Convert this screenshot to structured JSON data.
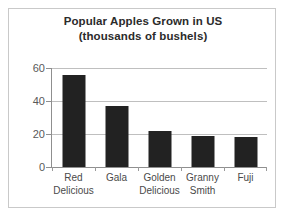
{
  "chart_data": {
    "type": "bar",
    "title": "Popular Apples Grown in US",
    "subtitle": "(thousands of bushels)",
    "xlabel": "",
    "ylabel": "",
    "ylim": [
      0,
      60
    ],
    "yticks": [
      0,
      20,
      40,
      60
    ],
    "ytick_labels": [
      "0",
      "20",
      "40",
      "60"
    ],
    "grid": true,
    "legend": "none",
    "categories": [
      "Red Delicious",
      "Gala",
      "Golden Delicious",
      "Granny Smith",
      "Fuji"
    ],
    "category_lines": [
      [
        "Red",
        "Delicious"
      ],
      [
        "Gala",
        ""
      ],
      [
        "Golden",
        "Delicious"
      ],
      [
        "Granny",
        "Smith"
      ],
      [
        "Fuji",
        ""
      ]
    ],
    "values": [
      56,
      37,
      22,
      19,
      18
    ],
    "bar_color": "#222222",
    "grid_color": "#bfbfbf",
    "axis_color": "#8f8f8f",
    "text_color": "#4a4a4a",
    "title_color": "#2b2b2b",
    "border_color": "#c9c9c9",
    "background": "#ffffff"
  }
}
